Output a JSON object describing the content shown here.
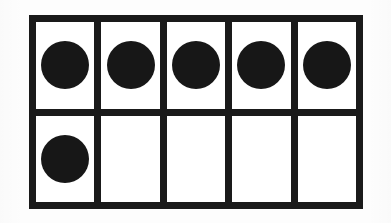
{
  "figure": {
    "kind": "ten-frame",
    "title": "Ten Frame",
    "description": "A ten frame with six black counters filled in.",
    "rows": 2,
    "columns": 5,
    "total_cells": 10,
    "filled_count": 6,
    "empty_count": 4,
    "background_color": "#fdfdfd",
    "frame_color": "#1a1a1a",
    "cell_color": "#ffffff",
    "counter_color": "#171717",
    "border_thickness_px": 7,
    "gridline_thickness_px": 7
  },
  "grid": {
    "rows": [
      {
        "row_label": "top-row",
        "cells": [
          {
            "cell_label": "cell-1",
            "filled": true
          },
          {
            "cell_label": "cell-2",
            "filled": true
          },
          {
            "cell_label": "cell-3",
            "filled": true
          },
          {
            "cell_label": "cell-4",
            "filled": true
          },
          {
            "cell_label": "cell-5",
            "filled": true
          }
        ]
      },
      {
        "row_label": "bottom-row",
        "cells": [
          {
            "cell_label": "cell-6",
            "filled": true
          },
          {
            "cell_label": "cell-7",
            "filled": false
          },
          {
            "cell_label": "cell-8",
            "filled": false
          },
          {
            "cell_label": "cell-9",
            "filled": false
          },
          {
            "cell_label": "cell-10",
            "filled": false
          }
        ]
      }
    ]
  },
  "chart_data": {
    "type": "table",
    "title": "Ten Frame",
    "xlabel": "",
    "ylabel": "",
    "categories": [
      "top-row",
      "bottom-row"
    ],
    "series": [
      {
        "name": "counters filled",
        "values": [
          5,
          1
        ]
      },
      {
        "name": "cells empty",
        "values": [
          0,
          4
        ]
      }
    ],
    "grid_matrix": [
      [
        1,
        1,
        1,
        1,
        1
      ],
      [
        1,
        0,
        0,
        0,
        0
      ]
    ],
    "value_represented": 6,
    "capacity": 10
  }
}
